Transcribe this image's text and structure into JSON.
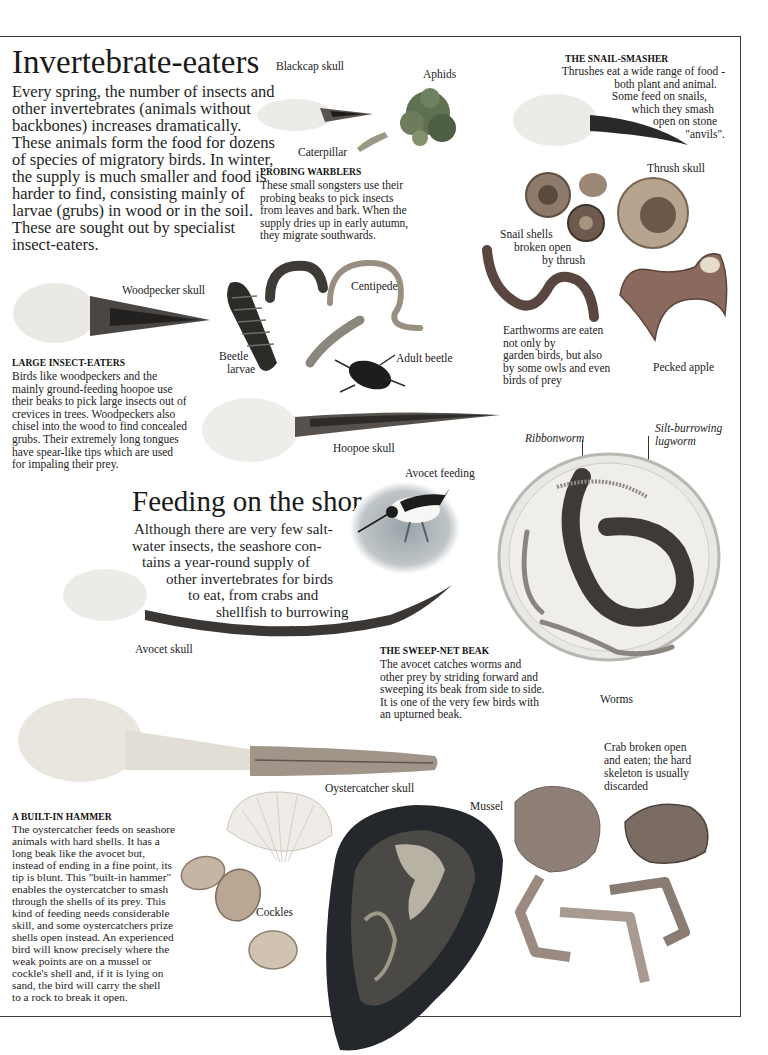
{
  "section_invertebrate": {
    "title": "Invertebrate-eaters",
    "intro_lines": [
      "Every spring, the number of insects and",
      "other invertebrates (animals without",
      "backbones) increases dramatically.",
      "These animals form the food for dozens",
      "of species of migratory birds. In winter,",
      "the supply is much smaller and food is",
      "harder to find, consisting mainly of",
      "larvae (grubs) in wood or in the soil.",
      "These are sought out by specialist",
      "insect-eaters."
    ]
  },
  "warblers": {
    "labels": {
      "blackcap_skull": "Blackcap skull",
      "aphids": "Aphids",
      "caterpillar": "Caterpillar"
    },
    "heading": "PROBING WARBLERS",
    "lines": [
      "These small songsters use their",
      "probing beaks to pick insects",
      "from leaves and bark. When the",
      "supply dries up in early autumn,",
      "they  migrate southwards."
    ]
  },
  "snail_smasher": {
    "heading": "THE SNAIL-SMASHER",
    "lines": [
      "Thrushes eat a wide range of food -",
      "both plant and animal.",
      "Some feed on snails,",
      "which they smash",
      "open on stone",
      "\"anvils\"."
    ],
    "labels": {
      "thrush_skull": "Thrush skull",
      "snail_shells": [
        "Snail shells",
        "broken open",
        "by thrush"
      ]
    }
  },
  "earthworms": {
    "lines": [
      "Earthworms are eaten",
      "not only by",
      "garden birds, but also",
      "by some owls and even",
      "birds of prey"
    ],
    "pecked_apple": "Pecked apple"
  },
  "large_insect_eaters": {
    "labels": {
      "woodpecker_skull": "Woodpecker skull",
      "centipede": "Centipede",
      "beetle_larvae": [
        "Beetle",
        "larvae"
      ],
      "adult_beetle": "Adult beetle",
      "hoopoe_skull": "Hoopoe skull"
    },
    "heading": "LARGE INSECT-EATERS",
    "lines": [
      "Birds like woodpeckers and the",
      "mainly ground-feeding hoopoe use",
      "their beaks to pick large insects out of",
      "crevices in trees. Woodpeckers also",
      "chisel into the wood to find concealed",
      "grubs. Their extremely long tongues",
      "have spear-like tips which are used",
      "for impaling their prey."
    ]
  },
  "section_shore": {
    "title": "Feeding on the shore",
    "intro_lines": [
      "Although there are very few salt-",
      "water insects, the seashore con-",
      "tains a year-round supply of",
      "other invertebrates for birds",
      "to eat, from crabs and",
      "shellfish to burrowing",
      "worms."
    ],
    "avocet_feeding": "Avocet feeding",
    "avocet_skull": "Avocet skull"
  },
  "worms": {
    "ribbonworm": "Ribbonworm",
    "lugworm": [
      "Silt-burrowing",
      "lugworm"
    ],
    "label": "Worms"
  },
  "sweep_net": {
    "heading": "THE SWEEP-NET BEAK",
    "lines": [
      "The avocet catches worms and",
      "other prey by striding forward and",
      "sweeping its beak from side to side.",
      "It is one of the very few birds with",
      "an upturned beak."
    ]
  },
  "hammer": {
    "heading": "A BUILT-IN HAMMER",
    "lines": [
      "The oystercatcher feeds on seashore",
      "animals with hard shells. It has a",
      "long beak like the avocet but,",
      "instead of ending in a fine point, its",
      "tip is blunt. This \"built-in hammer\"",
      "enables the oystercatcher to smash",
      "through the shells of its prey. This",
      "kind of feeding needs considerable",
      "skill, and some oystercatchers prize",
      "shells open instead. An experienced",
      "bird will know precisely where the",
      "weak points are on a mussel or",
      "cockle's shell and, if it is lying on",
      "sand, the bird will carry the shell",
      "to a rock to break it open."
    ],
    "labels": {
      "oystercatcher_skull": "Oystercatcher skull",
      "mussel": "Mussel",
      "cockles": "Cockles",
      "crab": [
        "Crab broken open",
        "and eaten; the hard",
        "skeleton is usually",
        "discarded"
      ]
    }
  },
  "colors": {
    "text": "#1c1c1c",
    "rule": "#3a3a3a",
    "bone": "#e9e6e0",
    "beak": "#3d3a36",
    "shell": "#a89886",
    "mussel": "#2b2e33",
    "crab": "#9a8a80"
  }
}
